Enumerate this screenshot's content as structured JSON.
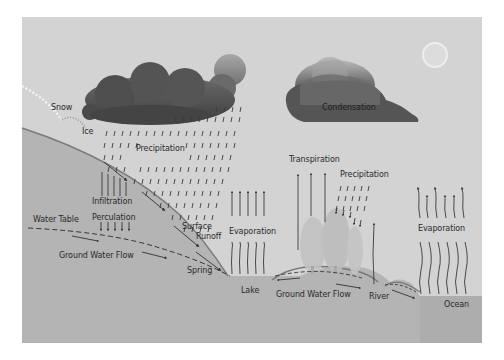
{
  "diagram": {
    "colors": {
      "sky": "#d3d3d3",
      "ground": "#b4b4b4",
      "ground_dark": "#acacac",
      "cloud_dark": "#4a4a4a",
      "cloud_mid": "#6e6e6e",
      "arrow": "#3a3a3a",
      "text": "#2a2a2a"
    },
    "labels": {
      "snow": "Snow",
      "ice": "Ice",
      "precipitation_left": "Precipitation",
      "condensation": "Condensation",
      "infiltration": "Infiltration",
      "perculation": "Perculation",
      "water_table": "Water Table",
      "ground_water_flow_left": "Ground Water Flow",
      "surface_runoff_line1": "Surface",
      "surface_runoff_line2": "Runoff",
      "spring": "Spring",
      "evaporation_lake": "Evaporation",
      "lake": "Lake",
      "transpiration": "Transpiration",
      "precipitation_right": "Precipitation",
      "ground_water_flow_right": "Ground Water Flow",
      "river": "River",
      "evaporation_ocean": "Evaporation",
      "ocean": "Ocean"
    },
    "icons": {
      "sun": "sun-icon",
      "cloud_left": "rain-cloud-icon",
      "cloud_right": "condensation-cloud-icon",
      "trees": "tree-icon"
    }
  }
}
